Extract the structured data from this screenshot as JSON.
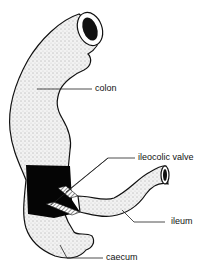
{
  "diagram": {
    "labels": {
      "colon": "colon",
      "ileocolic_valve": "ileocolic valve",
      "ileum": "ileum",
      "caecum": "caecum"
    },
    "colors": {
      "ink": "#111111",
      "stipple_fill": "#e8e8e8",
      "cut_section": "#050505",
      "background": "#ffffff"
    }
  }
}
